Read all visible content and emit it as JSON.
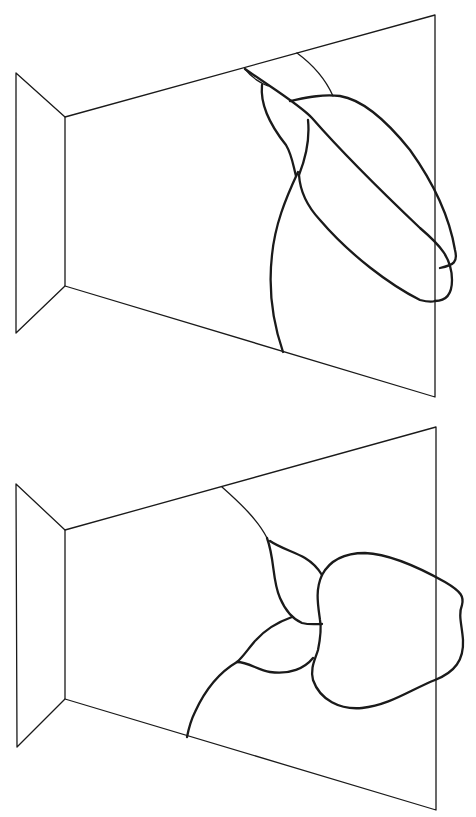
{
  "figure": {
    "panels": [
      {
        "id": "top",
        "shapes": [
          "left-side-wall",
          "back-wall-trapezoid",
          "elongated-overlapping-lobes"
        ]
      },
      {
        "id": "bottom",
        "shapes": [
          "left-side-wall",
          "back-wall-trapezoid",
          "rounded-blob-with-petal-shapes"
        ]
      }
    ],
    "colors": {
      "stroke": "#1a1a1a",
      "background": "#ffffff"
    }
  }
}
